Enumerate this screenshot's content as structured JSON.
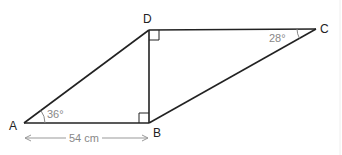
{
  "diagram": {
    "type": "geometry-figure",
    "vertices": {
      "A": {
        "label": "A"
      },
      "B": {
        "label": "B"
      },
      "C": {
        "label": "C"
      },
      "D": {
        "label": "D"
      }
    },
    "segments": [
      "AB",
      "BD",
      "AD",
      "DC",
      "BC"
    ],
    "right_angles": [
      "ABD",
      "BDC"
    ],
    "angles": [
      {
        "vertex": "A",
        "label": "36°"
      },
      {
        "vertex": "C",
        "label": "28°"
      }
    ],
    "dimension": {
      "from": "A",
      "to": "B",
      "label": "54 cm"
    },
    "colors": {
      "line": "#222222",
      "annotation": "#888888"
    }
  }
}
